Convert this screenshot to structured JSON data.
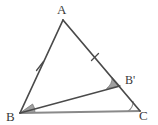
{
  "figure": {
    "kind": "geometry-diagram",
    "background": "#ffffff",
    "stroke_color": "#4a4a4a",
    "base_stroke_color": "#8a8a8a",
    "angle_fill": "#a0a0a0",
    "label_color": "#3a3a3a",
    "vertices": [
      {
        "id": "A",
        "label": "A",
        "x": 63,
        "y": 20
      },
      {
        "id": "B",
        "label": "B",
        "x": 20,
        "y": 113
      },
      {
        "id": "C",
        "label": "C",
        "x": 140,
        "y": 111
      },
      {
        "id": "Bp",
        "label": "B'",
        "x": 120,
        "y": 86
      }
    ],
    "segments": [
      {
        "name": "side-AB",
        "from": "A",
        "to": "B",
        "style": "solid",
        "color": "#4a4a4a",
        "width": 1.6
      },
      {
        "name": "side-AC",
        "from": "A",
        "to": "C",
        "style": "solid",
        "color": "#4a4a4a",
        "width": 1.6
      },
      {
        "name": "side-BC",
        "from": "B",
        "to": "C",
        "style": "solid",
        "color": "#8a8a8a",
        "width": 2.2
      },
      {
        "name": "cevian-BBp",
        "from": "B",
        "to": "Bp",
        "style": "solid",
        "color": "#4a4a4a",
        "width": 1.3
      }
    ],
    "tick_marks": [
      {
        "name": "tick-AB",
        "on": "side-AB",
        "x": 40,
        "y": 66,
        "count": 1
      },
      {
        "name": "tick-AC",
        "on": "side-AC",
        "x": 95,
        "y": 57,
        "count": 1
      }
    ],
    "angle_marks": [
      {
        "name": "angle-B",
        "at": "B",
        "filled": true,
        "radius": 13
      },
      {
        "name": "angle-Bp",
        "at": "Bp",
        "filled": true,
        "radius": 13
      },
      {
        "name": "angle-C",
        "at": "C",
        "filled": false,
        "radius": 11
      }
    ]
  }
}
